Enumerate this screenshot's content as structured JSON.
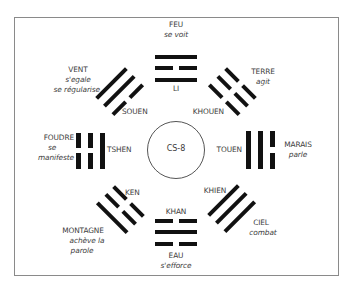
{
  "diagram": {
    "center": {
      "label": "CS-8"
    },
    "trigrams": [
      {
        "id": "li",
        "name": "LI",
        "element": "FEU",
        "verb": [
          "se voit"
        ],
        "position": "top",
        "lines_outer_to_inner": [
          "solid",
          "broken",
          "solid"
        ]
      },
      {
        "id": "khouen",
        "name": "KHOUEN",
        "element": "TERRE",
        "verb": [
          "agit"
        ],
        "position": "top-right",
        "lines_outer_to_inner": [
          "broken",
          "broken",
          "broken"
        ]
      },
      {
        "id": "touen",
        "name": "TOUEN",
        "element": "MARAIS",
        "verb": [
          "parle"
        ],
        "position": "right",
        "lines_outer_to_inner": [
          "broken",
          "solid",
          "solid"
        ]
      },
      {
        "id": "khien",
        "name": "KHIEN",
        "element": "CIEL",
        "verb": [
          "combat"
        ],
        "position": "bottom-right",
        "lines_outer_to_inner": [
          "solid",
          "solid",
          "solid"
        ]
      },
      {
        "id": "khan",
        "name": "KHAN",
        "element": "EAU",
        "verb": [
          "s'efforce"
        ],
        "position": "bottom",
        "lines_outer_to_inner": [
          "broken",
          "solid",
          "broken"
        ]
      },
      {
        "id": "ken",
        "name": "KEN",
        "element": "MONTAGNE",
        "verb": [
          "achève la",
          "parole"
        ],
        "position": "bottom-left",
        "lines_outer_to_inner": [
          "solid",
          "broken",
          "broken"
        ]
      },
      {
        "id": "tshen",
        "name": "TSHEN",
        "element": "FOUDRE",
        "verb": [
          "se",
          "manifeste"
        ],
        "position": "left",
        "lines_outer_to_inner": [
          "broken",
          "broken",
          "solid"
        ]
      },
      {
        "id": "souen",
        "name": "SOUEN",
        "element": "VENT",
        "verb": [
          "s'egale",
          "se régularise"
        ],
        "position": "top-left",
        "lines_outer_to_inner": [
          "solid",
          "solid",
          "broken"
        ]
      }
    ]
  },
  "colors": {
    "line": "#111111",
    "text": "#3d3d3d",
    "frame": "#8a8a8a"
  }
}
